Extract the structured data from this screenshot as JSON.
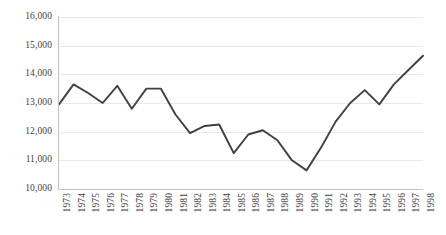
{
  "chart_data": {
    "type": "line",
    "title": "",
    "subtitle": "",
    "xlabel": "",
    "ylabel": "",
    "grid": true,
    "legend": false,
    "legend_position": "none",
    "line_color": "#404040",
    "gridline_color": "#e9e9e9",
    "axis_color": "#c2c2c2",
    "ylim": [
      10000,
      16000
    ],
    "ytick_step": 1000,
    "yticks": [
      "10,000",
      "11,000",
      "12,000",
      "13,000",
      "14,000",
      "15,000",
      "16,000"
    ],
    "ytick_values": [
      10000,
      11000,
      12000,
      13000,
      14000,
      15000,
      16000
    ],
    "categories": [
      "1973",
      "1974",
      "1975",
      "1976",
      "1977",
      "1978",
      "1979",
      "1980",
      "1981",
      "1982",
      "1983",
      "1984",
      "1985",
      "1986",
      "1987",
      "1988",
      "1989",
      "1990",
      "1991",
      "1992",
      "1993",
      "1994",
      "1995",
      "1996",
      "1997",
      "1998"
    ],
    "x": [
      1973,
      1974,
      1975,
      1976,
      1977,
      1978,
      1979,
      1980,
      1981,
      1982,
      1983,
      1984,
      1985,
      1986,
      1987,
      1988,
      1989,
      1990,
      1991,
      1992,
      1993,
      1994,
      1995,
      1996,
      1997,
      1998
    ],
    "values": [
      12950,
      13650,
      13350,
      13000,
      13600,
      12800,
      13500,
      13500,
      12600,
      11950,
      12200,
      12250,
      11250,
      11900,
      12050,
      11700,
      11000,
      10650,
      11450,
      12350,
      13000,
      13450,
      12950,
      13650,
      14150,
      14650
    ],
    "series": [
      {
        "name": "series-1",
        "values": [
          12950,
          13650,
          13350,
          13000,
          13600,
          12800,
          13500,
          13500,
          12600,
          11950,
          12200,
          12250,
          11250,
          11900,
          12050,
          11700,
          11000,
          10650,
          11450,
          12350,
          13000,
          13450,
          12950,
          13650,
          14150,
          14650
        ]
      }
    ]
  }
}
